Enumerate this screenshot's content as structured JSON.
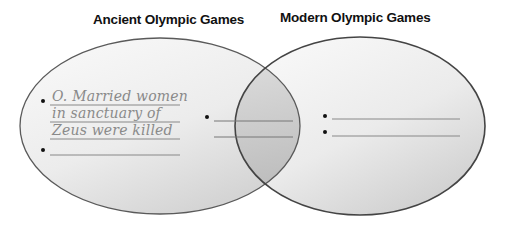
{
  "diagram": {
    "type": "venn",
    "sets": [
      {
        "name": "left-circle",
        "title": "Ancient Olympic Games",
        "entries": [
          "O. Married women in sanctuary of Zeus were killed",
          ""
        ],
        "handwritten_lines": [
          "O. Married women",
          "in sanctuary of",
          "Zeus were killed"
        ]
      },
      {
        "name": "overlap",
        "title": "",
        "entries": [
          ""
        ]
      },
      {
        "name": "right-circle",
        "title": "Modern Olympic Games",
        "entries": [
          "",
          ""
        ]
      }
    ],
    "colors": {
      "outline": "#555555",
      "fill_light": "#f4f4f4",
      "fill_shadow": "#c8c8c8",
      "handwriting": "#8a8a8a"
    }
  }
}
